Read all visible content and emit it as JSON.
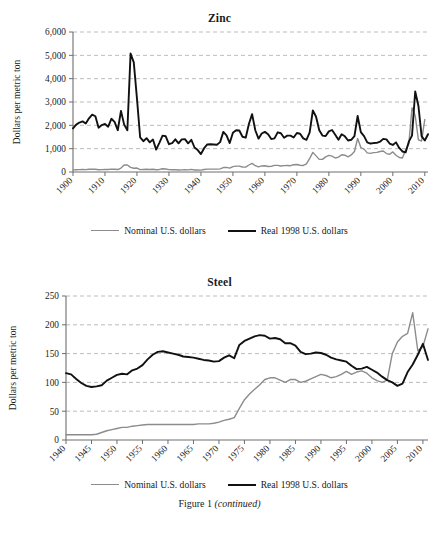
{
  "figure": {
    "caption_main": "Figure 1",
    "caption_note": "(continued)"
  },
  "legend": {
    "nominal_label": "Nominal U.S. dollars",
    "real_label": "Real 1998 U.S. dollars",
    "nominal_color": "#8c8c8c",
    "real_color": "#111111"
  },
  "chart_data": [
    {
      "type": "line",
      "title": "Zinc",
      "xlabel": "",
      "ylabel": "Dollars per metric ton",
      "xlim": [
        1900,
        2011
      ],
      "ylim": [
        0,
        6000
      ],
      "xticks": [
        1900,
        1910,
        1920,
        1930,
        1940,
        1950,
        1960,
        1970,
        1980,
        1990,
        2000,
        2010
      ],
      "xtick_labels": [
        "1900",
        "1910",
        "1920",
        "1930",
        "1940",
        "1950",
        "1960",
        "1970",
        "1980",
        "1990",
        "2000",
        "2010"
      ],
      "yticks": [
        0,
        1000,
        2000,
        3000,
        4000,
        5000,
        6000
      ],
      "ytick_labels": [
        "0",
        "1,000",
        "2,000",
        "3,000",
        "4,000",
        "5,000",
        "6,000"
      ],
      "grid": true,
      "legend_position": "below",
      "x": [
        1900,
        1901,
        1902,
        1903,
        1904,
        1905,
        1906,
        1907,
        1908,
        1909,
        1910,
        1911,
        1912,
        1913,
        1914,
        1915,
        1916,
        1917,
        1918,
        1919,
        1920,
        1921,
        1922,
        1923,
        1924,
        1925,
        1926,
        1927,
        1928,
        1929,
        1930,
        1931,
        1932,
        1933,
        1934,
        1935,
        1936,
        1937,
        1938,
        1939,
        1940,
        1941,
        1942,
        1943,
        1944,
        1945,
        1946,
        1947,
        1948,
        1949,
        1950,
        1951,
        1952,
        1953,
        1954,
        1955,
        1956,
        1957,
        1958,
        1959,
        1960,
        1961,
        1962,
        1963,
        1964,
        1965,
        1966,
        1967,
        1968,
        1969,
        1970,
        1971,
        1972,
        1973,
        1974,
        1975,
        1976,
        1977,
        1978,
        1979,
        1980,
        1981,
        1982,
        1983,
        1984,
        1985,
        1986,
        1987,
        1988,
        1989,
        1990,
        1991,
        1992,
        1993,
        1994,
        1995,
        1996,
        1997,
        1998,
        1999,
        2000,
        2001,
        2002,
        2003,
        2004,
        2005,
        2006,
        2007,
        2008,
        2009,
        2010,
        2011
      ],
      "series": [
        {
          "name": "Real 1998 U.S. dollars",
          "color": "#111111",
          "width": 1.9,
          "values": [
            1870,
            2030,
            2120,
            2170,
            2080,
            2300,
            2460,
            2390,
            1900,
            2010,
            2060,
            1940,
            2280,
            2150,
            1790,
            2620,
            2030,
            1790,
            5080,
            4700,
            3150,
            1480,
            1320,
            1450,
            1270,
            1390,
            960,
            1250,
            1560,
            1530,
            1190,
            1240,
            1400,
            1230,
            1400,
            1410,
            1230,
            1380,
            1050,
            940,
            770,
            1020,
            1180,
            1190,
            1180,
            1170,
            1280,
            1720,
            1570,
            1240,
            1680,
            1790,
            1780,
            1510,
            1470,
            2060,
            2480,
            1790,
            1430,
            1650,
            1720,
            1620,
            1410,
            1440,
            1700,
            1660,
            1470,
            1560,
            1560,
            1480,
            1670,
            1640,
            1440,
            1380,
            1700,
            2640,
            2370,
            1790,
            1560,
            1540,
            1740,
            1800,
            1600,
            1380,
            1620,
            1530,
            1350,
            1380,
            1540,
            2400,
            1710,
            1540,
            1270,
            1220,
            1240,
            1250,
            1300,
            1420,
            1400,
            1220,
            1160,
            1270,
            1030,
            880,
            840,
            1300,
            1560,
            3450,
            2840,
            1540,
            1350,
            1620
          ]
        },
        {
          "name": "Nominal U.S. dollars",
          "color": "#8c8c8c",
          "width": 1.4,
          "values": [
            90,
            95,
            100,
            105,
            100,
            115,
            125,
            120,
            95,
            100,
            110,
            105,
            125,
            120,
            105,
            170,
            300,
            300,
            200,
            160,
            170,
            100,
            110,
            120,
            110,
            120,
            95,
            110,
            140,
            130,
            100,
            95,
            95,
            85,
            90,
            95,
            90,
            110,
            85,
            90,
            80,
            105,
            125,
            125,
            125,
            125,
            135,
            190,
            200,
            165,
            230,
            250,
            250,
            215,
            210,
            300,
            370,
            270,
            220,
            260,
            270,
            235,
            240,
            285,
            285,
            255,
            275,
            280,
            270,
            310,
            320,
            290,
            280,
            350,
            580,
            840,
            690,
            540,
            540,
            650,
            710,
            680,
            600,
            640,
            740,
            720,
            650,
            730,
            880,
            1440,
            1050,
            980,
            820,
            800,
            830,
            840,
            880,
            900,
            790,
            760,
            860,
            720,
            620,
            600,
            940,
            1200,
            2750,
            2410,
            1380,
            1330,
            2250
          ]
        }
      ]
    },
    {
      "type": "line",
      "title": "Steel",
      "xlabel": "",
      "ylabel": "Dollars per metric ton",
      "xlim": [
        1940,
        2011
      ],
      "ylim": [
        0,
        250
      ],
      "xticks": [
        1940,
        1945,
        1950,
        1955,
        1960,
        1965,
        1970,
        1975,
        1980,
        1985,
        1990,
        1995,
        2000,
        2005,
        2010
      ],
      "xtick_labels": [
        "1940",
        "1945",
        "1950",
        "1955",
        "1960",
        "1965",
        "1970",
        "1975",
        "1980",
        "1985",
        "1990",
        "1995",
        "2000",
        "2005",
        "2010"
      ],
      "yticks": [
        0,
        50,
        100,
        150,
        200,
        250
      ],
      "ytick_labels": [
        "0",
        "50",
        "100",
        "150",
        "200",
        "250"
      ],
      "grid": true,
      "legend_position": "below",
      "x": [
        1940,
        1941,
        1942,
        1943,
        1944,
        1945,
        1946,
        1947,
        1948,
        1949,
        1950,
        1951,
        1952,
        1953,
        1954,
        1955,
        1956,
        1957,
        1958,
        1959,
        1960,
        1961,
        1962,
        1963,
        1964,
        1965,
        1966,
        1967,
        1968,
        1969,
        1970,
        1971,
        1972,
        1973,
        1974,
        1975,
        1976,
        1977,
        1978,
        1979,
        1980,
        1981,
        1982,
        1983,
        1984,
        1985,
        1986,
        1987,
        1988,
        1989,
        1990,
        1991,
        1992,
        1993,
        1994,
        1995,
        1996,
        1997,
        1998,
        1999,
        2000,
        2001,
        2002,
        2003,
        2004,
        2005,
        2006,
        2007,
        2008,
        2009,
        2010,
        2011
      ],
      "series": [
        {
          "name": "Real 1998 U.S. dollars",
          "color": "#111111",
          "width": 1.9,
          "values": [
            116,
            114,
            106,
            99,
            94,
            92,
            93,
            95,
            103,
            108,
            113,
            115,
            114,
            121,
            124,
            130,
            140,
            148,
            153,
            154,
            152,
            150,
            148,
            145,
            144,
            143,
            141,
            139,
            138,
            136,
            137,
            143,
            147,
            142,
            165,
            172,
            176,
            180,
            182,
            181,
            176,
            177,
            175,
            168,
            168,
            164,
            153,
            149,
            150,
            152,
            151,
            148,
            143,
            140,
            138,
            136,
            129,
            123,
            124,
            127,
            122,
            117,
            110,
            104,
            100,
            94,
            98,
            118,
            131,
            148,
            167,
            139
          ]
        },
        {
          "name": "Nominal U.S. dollars",
          "color": "#8c8c8c",
          "width": 1.4,
          "values": [
            9,
            9,
            9,
            9,
            9,
            9,
            10,
            13,
            16,
            18,
            20,
            22,
            22,
            24,
            25,
            26,
            27,
            27,
            27,
            27,
            27,
            27,
            27,
            27,
            27,
            27,
            28,
            28,
            28,
            29,
            31,
            34,
            36,
            39,
            55,
            70,
            80,
            88,
            96,
            105,
            108,
            108,
            104,
            100,
            105,
            105,
            100,
            102,
            106,
            110,
            114,
            112,
            108,
            110,
            114,
            119,
            114,
            118,
            120,
            116,
            108,
            103,
            100,
            104,
            150,
            170,
            180,
            185,
            221,
            155,
            162,
            193
          ]
        }
      ]
    }
  ]
}
